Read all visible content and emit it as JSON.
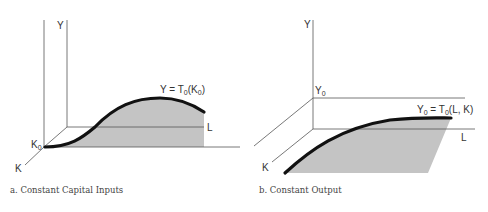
{
  "panel_a": {
    "y_axis_label": "Y",
    "l_axis_label": "L",
    "k_axis_label": "K",
    "k0_label": "K",
    "k0_sub": "0",
    "curve_label_pre": "Y = T",
    "curve_label_sub": "0",
    "curve_label_post": "(K",
    "curve_label_sub2": "0",
    "curve_label_end": ")",
    "caption": "a.  Constant Capital Inputs"
  },
  "panel_b": {
    "y_axis_label": "Y",
    "y0_label": "Y",
    "y0_sub": "0",
    "l_axis_label": "L",
    "k_axis_label": "K",
    "curve_label_pre": "Y",
    "curve_label_sub": "0",
    "curve_label_mid": " = T",
    "curve_label_sub2": "0",
    "curve_label_end": "(L, K)",
    "caption": "b.  Constant Output"
  },
  "colors": {
    "shade": "#c4c4c4",
    "curve": "#111111",
    "axis": "#555555"
  }
}
